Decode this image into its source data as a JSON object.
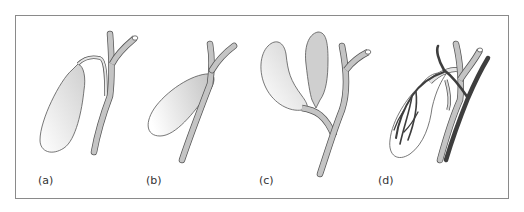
{
  "figure": {
    "panels": [
      {
        "id": "a",
        "label": "(a)"
      },
      {
        "id": "b",
        "label": "(b)"
      },
      {
        "id": "c",
        "label": "(c)"
      },
      {
        "id": "d",
        "label": "(d)"
      }
    ],
    "colors": {
      "duct_fill": "#c4c4c4",
      "outline": "#555555",
      "artery": "#4a4a4a",
      "frame": "#8a8a8a"
    }
  }
}
